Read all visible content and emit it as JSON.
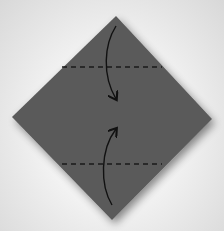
{
  "diagram": {
    "type": "origami-fold-step",
    "paper": {
      "shape": "square-diamond",
      "color": "#5a5a5a",
      "vertices": {
        "top": [
          116,
          16
        ],
        "left": [
          12,
          117
        ],
        "right": [
          212,
          119
        ],
        "bottom": [
          112,
          220
        ]
      }
    },
    "fold_lines": [
      {
        "style": "valley-dashed",
        "y": 67,
        "x1": 62,
        "x2": 162
      },
      {
        "style": "valley-dashed",
        "y": 164,
        "x1": 62,
        "x2": 162
      }
    ],
    "arrows": [
      {
        "name": "fold-top-corner-down",
        "from": [
          116,
          26
        ],
        "to": [
          116,
          100
        ]
      },
      {
        "name": "fold-bottom-corner-up",
        "from": [
          112,
          205
        ],
        "to": [
          116,
          128
        ]
      }
    ],
    "colors": {
      "line": "#111111",
      "background": "#eeeeee"
    }
  }
}
